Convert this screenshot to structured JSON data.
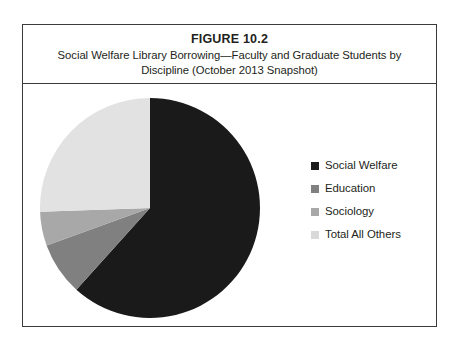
{
  "figure": {
    "number": "FIGURE 10.2",
    "caption": "Social Welfare Library Borrowing—Faculty and Graduate Students by Discipline (October 2013 Snapshot)"
  },
  "legend": {
    "items": [
      {
        "label": "Social Welfare",
        "color": "#1a1a1a",
        "icon": "square-swatch-icon"
      },
      {
        "label": "Education",
        "color": "#808080",
        "icon": "square-swatch-icon"
      },
      {
        "label": "Sociology",
        "color": "#a8a8a8",
        "icon": "square-swatch-icon"
      },
      {
        "label": "Total All Others",
        "color": "#d9d9d9",
        "icon": "square-swatch-icon"
      }
    ]
  },
  "chart_data": {
    "type": "pie",
    "title": "Social Welfare Library Borrowing—Faculty and Graduate Students by Discipline (October 2013 Snapshot)",
    "xlabel": "",
    "ylabel": "",
    "legend_position": "right",
    "grid": false,
    "start_angle_deg": 0,
    "direction": "clockwise",
    "categories": [
      "Social Welfare",
      "Education",
      "Sociology",
      "Total All Others"
    ],
    "values": [
      61.7,
      7.8,
      5.0,
      25.5
    ],
    "colors": [
      "#1a1a1a",
      "#808080",
      "#a8a8a8",
      "#e2e2e2"
    ],
    "slice_angles_deg": [
      222,
      28,
      18,
      92
    ],
    "geometry": {
      "center_x": 113,
      "center_y": 113,
      "radius": 110
    }
  }
}
